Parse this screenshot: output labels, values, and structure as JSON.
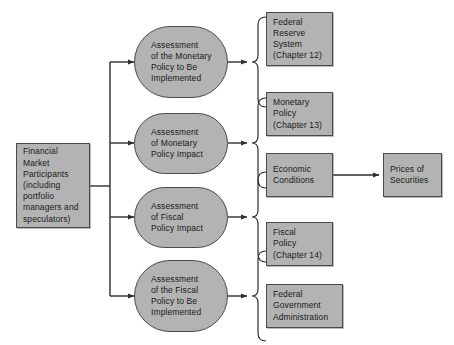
{
  "figure": {
    "fill_color": "#b3b3b3",
    "stroke_color": "#4a4a4a",
    "background_color": "#ffffff"
  },
  "source": {
    "name": "financial-market-participants",
    "lines": [
      "Financial",
      "Market",
      "Participants",
      "(including",
      "portfolio",
      "managers and",
      "speculators)"
    ]
  },
  "assessments": [
    {
      "name": "assessment-monetary-policy-to-be-implemented",
      "lines": [
        "Assessment",
        "of the Monetary",
        "Policy to Be",
        "Implemented"
      ]
    },
    {
      "name": "assessment-monetary-policy-impact",
      "lines": [
        "Assessment",
        "of Monetary",
        "Policy Impact"
      ]
    },
    {
      "name": "assessment-fiscal-policy-impact",
      "lines": [
        "Assessment",
        "of Fiscal",
        "Policy Impact"
      ]
    },
    {
      "name": "assessment-fiscal-policy-to-be-implemented",
      "lines": [
        "Assessment",
        "of the Fiscal",
        "Policy to Be",
        "Implemented"
      ]
    }
  ],
  "factors": [
    {
      "name": "federal-reserve-system",
      "lines": [
        "Federal",
        "Reserve",
        "System",
        "(Chapter 12)"
      ]
    },
    {
      "name": "monetary-policy",
      "lines": [
        "Monetary",
        "Policy",
        "(Chapter 13)"
      ]
    },
    {
      "name": "economic-conditions",
      "lines": [
        "Economic",
        "Conditions"
      ]
    },
    {
      "name": "fiscal-policy",
      "lines": [
        "Fiscal",
        "Policy",
        "(Chapter 14)"
      ]
    },
    {
      "name": "federal-government-administration",
      "lines": [
        "Federal",
        "Government",
        "Administration"
      ]
    }
  ],
  "outcome": {
    "name": "prices-of-securities",
    "lines": [
      "Prices of",
      "Securities"
    ]
  }
}
